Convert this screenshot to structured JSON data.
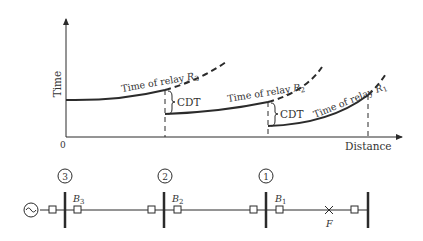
{
  "graph": {
    "y_axis_label": "Time",
    "x_axis_label": "Distance",
    "origin_label": "0",
    "curves": [
      {
        "relay": "R3",
        "label_prefix": "Time of relay ",
        "label_var": "R",
        "label_sub": "3"
      },
      {
        "relay": "R2",
        "label_prefix": "Time of relay ",
        "label_var": "R",
        "label_sub": "2"
      },
      {
        "relay": "R1",
        "label_prefix": "Time of relay ",
        "label_var": "R",
        "label_sub": "1"
      }
    ],
    "cdt_labels": [
      "CDT",
      "CDT"
    ]
  },
  "single_line": {
    "source_symbol": "~",
    "buses": [
      {
        "number": "3",
        "breaker_var": "B",
        "breaker_sub": "3"
      },
      {
        "number": "2",
        "breaker_var": "B",
        "breaker_sub": "2"
      },
      {
        "number": "1",
        "breaker_var": "B",
        "breaker_sub": "1"
      }
    ],
    "fault_label": "F",
    "fault_symbol": "×"
  },
  "colors": {
    "line": "#2b2b2b",
    "text": "#333333",
    "background": "#ffffff"
  }
}
